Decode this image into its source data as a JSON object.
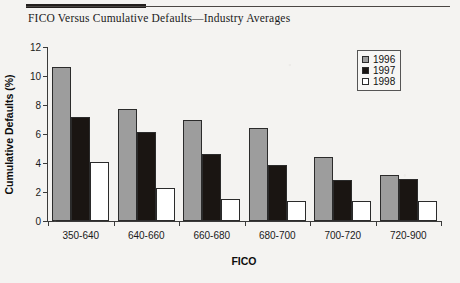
{
  "figure": {
    "title": "FICO Versus Cumulative Defaults—Industry Averages"
  },
  "legend": {
    "position": "top-right",
    "entries": [
      {
        "label": "1996",
        "color": "#9d9d9d"
      },
      {
        "label": "1997",
        "color": "#1a1512"
      },
      {
        "label": "1998",
        "color": "#ffffff"
      }
    ]
  },
  "axes": {
    "y_title": "Cumulative Defaults (%)",
    "x_title": "FICO",
    "y_ticks": [
      "0",
      "2",
      "4",
      "6",
      "8",
      "10",
      "12"
    ],
    "x_ticks": [
      "350-640",
      "640-660",
      "660-680",
      "680-700",
      "700-720",
      "720-900"
    ]
  },
  "chart_data": {
    "type": "bar",
    "title": "FICO Versus Cumulative Defaults—Industry Averages",
    "xlabel": "FICO",
    "ylabel": "Cumulative Defaults (%)",
    "ylim": [
      0,
      12
    ],
    "ytick_step": 2,
    "grid": false,
    "legend_position": "top-right",
    "categories": [
      "350-640",
      "640-660",
      "660-680",
      "680-700",
      "700-720",
      "720-900"
    ],
    "series": [
      {
        "name": "1996",
        "color": "#9d9d9d",
        "values": [
          10.6,
          7.7,
          6.95,
          6.4,
          4.4,
          3.15
        ]
      },
      {
        "name": "1997",
        "color": "#1a1512",
        "values": [
          7.2,
          6.15,
          4.6,
          3.85,
          2.85,
          2.9
        ]
      },
      {
        "name": "1998",
        "color": "#ffffff",
        "values": [
          4.1,
          2.25,
          1.55,
          1.35,
          1.4,
          1.4
        ]
      }
    ]
  }
}
